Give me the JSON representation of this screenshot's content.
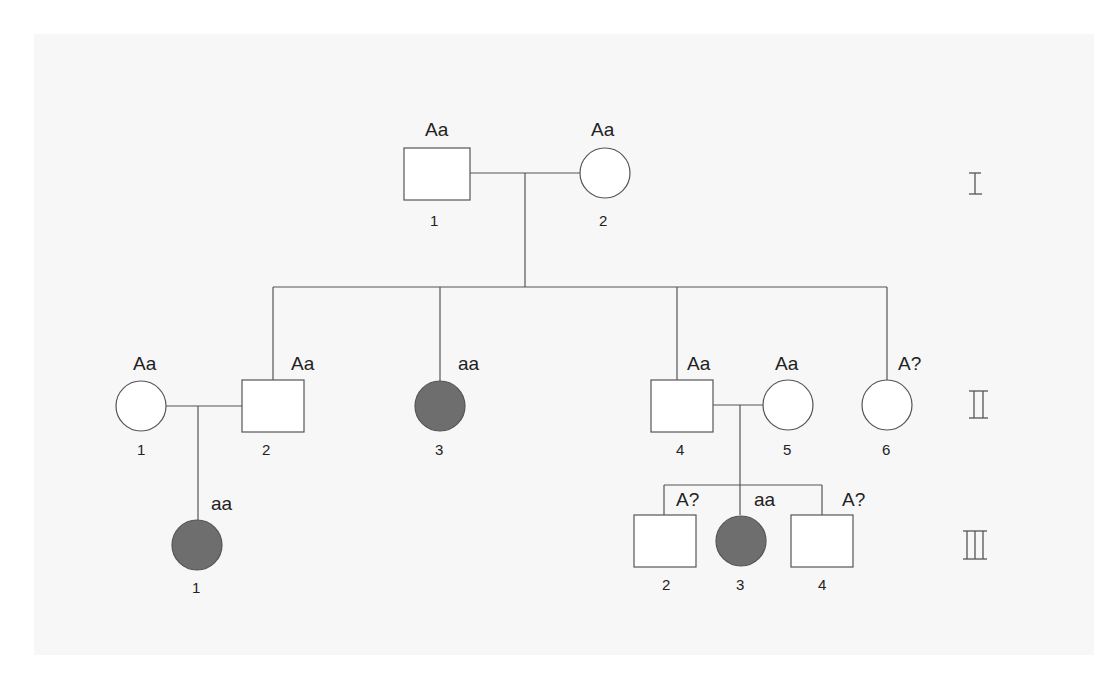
{
  "title": "",
  "legend_note": "",
  "generations": [
    {
      "roman": "I",
      "label": "generation-I"
    },
    {
      "roman": "II",
      "label": "generation-II"
    },
    {
      "roman": "III",
      "label": "generation-III"
    }
  ],
  "individuals": {
    "I_1": {
      "sex": "male",
      "affected": false,
      "genotype": "Aa",
      "number": "1"
    },
    "I_2": {
      "sex": "female",
      "affected": false,
      "genotype": "Aa",
      "number": "2"
    },
    "II_1": {
      "sex": "female",
      "affected": false,
      "genotype": "Aa",
      "number": "1"
    },
    "II_2": {
      "sex": "male",
      "affected": false,
      "genotype": "Aa",
      "number": "2"
    },
    "II_3": {
      "sex": "female",
      "affected": true,
      "genotype": "aa",
      "number": "3"
    },
    "II_4": {
      "sex": "male",
      "affected": false,
      "genotype": "Aa",
      "number": "4"
    },
    "II_5": {
      "sex": "female",
      "affected": false,
      "genotype": "Aa",
      "number": "5"
    },
    "II_6": {
      "sex": "female",
      "affected": false,
      "genotype": "A?",
      "number": "6"
    },
    "III_1": {
      "sex": "female",
      "affected": true,
      "genotype": "aa",
      "number": "1"
    },
    "III_2": {
      "sex": "male",
      "affected": false,
      "genotype": "A?",
      "number": "2"
    },
    "III_3": {
      "sex": "female",
      "affected": true,
      "genotype": "aa",
      "number": "3"
    },
    "III_4": {
      "sex": "male",
      "affected": false,
      "genotype": "A?",
      "number": "4"
    }
  },
  "colors": {
    "affected_fill": "#6e6e6e",
    "line": "#555555",
    "panel_bg": "#f7f7f7"
  }
}
